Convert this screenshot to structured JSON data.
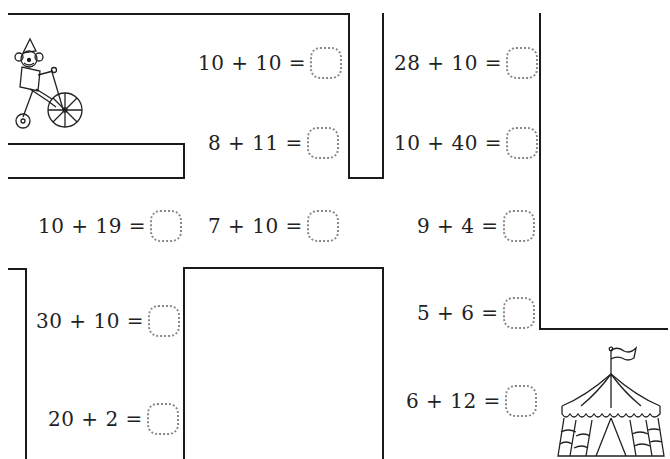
{
  "worksheet": {
    "type": "addition maze",
    "equations": [
      {
        "id": "eq1",
        "expr": "10 + 10 =",
        "answer": ""
      },
      {
        "id": "eq2",
        "expr": "8 + 11 =",
        "answer": ""
      },
      {
        "id": "eq3",
        "expr": "28 + 10 =",
        "answer": ""
      },
      {
        "id": "eq4",
        "expr": "10 + 40 =",
        "answer": ""
      },
      {
        "id": "eq5",
        "expr": "10 + 19 =",
        "answer": ""
      },
      {
        "id": "eq6",
        "expr": "7 + 10 =",
        "answer": ""
      },
      {
        "id": "eq7",
        "expr": "9 + 4 =",
        "answer": ""
      },
      {
        "id": "eq8",
        "expr": "30 + 10 =",
        "answer": ""
      },
      {
        "id": "eq9",
        "expr": "5 + 6 =",
        "answer": ""
      },
      {
        "id": "eq10",
        "expr": "6 + 12 =",
        "answer": ""
      },
      {
        "id": "eq11",
        "expr": "20 + 2 =",
        "answer": ""
      }
    ],
    "start_icon": "clown-on-unicycle-icon",
    "finish_icon": "circus-tent-icon",
    "colors": {
      "line": "#1a1a1a",
      "text": "#222222",
      "dotted_box": "#888888"
    }
  }
}
